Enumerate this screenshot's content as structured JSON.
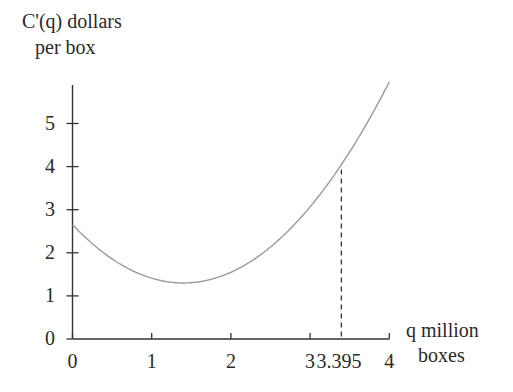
{
  "chart_data": {
    "type": "line",
    "title": "",
    "ylabel": "C'(q) dollars per box",
    "ylabel_lines": [
      "C'(q) dollars",
      "per box"
    ],
    "xlabel": "q million boxes",
    "xlabel_lines": [
      "q million",
      "boxes"
    ],
    "xlim": [
      0,
      4
    ],
    "ylim": [
      0,
      6
    ],
    "x_ticks": [
      0,
      1,
      2,
      3,
      3.395,
      4
    ],
    "x_tick_labels": [
      "0",
      "1",
      "2",
      "3",
      "3.395",
      "4"
    ],
    "y_ticks": [
      0,
      1,
      2,
      3,
      4,
      5
    ],
    "y_tick_labels": [
      "0",
      "1",
      "2",
      "3",
      "4",
      "5"
    ],
    "grid": false,
    "legend": null,
    "series": [
      {
        "name": "C'(q)",
        "x": [
          0,
          0.5,
          1,
          1.4,
          2,
          2.5,
          3,
          3.395,
          3.5,
          4
        ],
        "y": [
          2.7,
          1.86,
          1.41,
          1.3,
          1.55,
          2.13,
          3.07,
          3.93,
          4.15,
          5.9
        ]
      }
    ],
    "annotations": [
      {
        "type": "vertical-dashed-line",
        "x": 3.395,
        "y_from": 0,
        "y_to": 3.93
      }
    ],
    "colors": {
      "axis": "#333333",
      "curve": "#9a9a9a",
      "dashed": "#333333"
    }
  }
}
